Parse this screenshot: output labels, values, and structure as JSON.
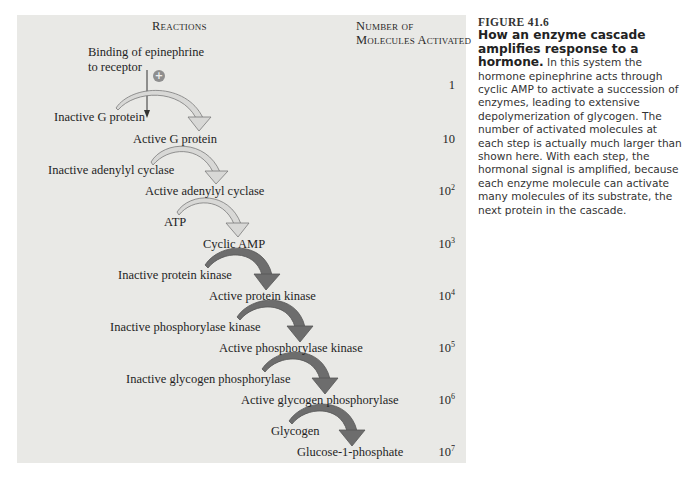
{
  "diagram": {
    "headers": {
      "reactions": "Reactions",
      "molecules_line1": "Number of",
      "molecules_line2": "Molecules Activated"
    },
    "trigger": {
      "line1": "Binding of epinephrine",
      "line2": "to receptor",
      "sign": "+"
    },
    "steps": [
      {
        "input": "Inactive G protein",
        "output": "Active G protein",
        "count_base": "10",
        "count_exp": "",
        "count_text": "10",
        "arrow_style": "light"
      },
      {
        "input": "Inactive adenylyl cyclase",
        "output": "Active adenylyl cyclase",
        "count_base": "10",
        "count_exp": "2",
        "arrow_style": "light"
      },
      {
        "input": "ATP",
        "output": "Cyclic AMP",
        "count_base": "10",
        "count_exp": "3",
        "arrow_style": "light"
      },
      {
        "input": "Inactive protein kinase",
        "output": "Active protein kinase",
        "count_base": "10",
        "count_exp": "4",
        "arrow_style": "dark"
      },
      {
        "input": "Inactive phosphorylase kinase",
        "output": "Active phosphorylase kinase",
        "count_base": "10",
        "count_exp": "5",
        "arrow_style": "dark"
      },
      {
        "input": "Inactive glycogen phosphorylase",
        "output": "Active glycogen phosphorylase",
        "count_base": "10",
        "count_exp": "6",
        "arrow_style": "dark"
      },
      {
        "input": "Glycogen",
        "output": "Glucose-1-phosphate",
        "count_base": "10",
        "count_exp": "7",
        "arrow_style": "dark"
      }
    ],
    "trigger_count": "1",
    "colors": {
      "panel_bg": "#e9e9e6",
      "light_arrow_fill": "#d8d8d6",
      "light_arrow_stroke": "#7a7a7a",
      "dark_arrow_fill": "#6d6d6d",
      "dark_arrow_stroke": "#555555",
      "plus_circle": "#8e8e8e"
    }
  },
  "caption": {
    "figure_label": "FIGURE 41.6",
    "title": "How an enzyme cascade amplifies response to a hormone.",
    "body": " In this system the hormone epinephrine acts through cyclic AMP to activate a succession of enzymes, leading to extensive depolymerization of glycogen. The number of activated molecules at each step is actually much larger than shown here. With each step, the hormonal signal is amplified, because each enzyme molecule can activate many molecules of its substrate, the next protein in the cascade."
  }
}
